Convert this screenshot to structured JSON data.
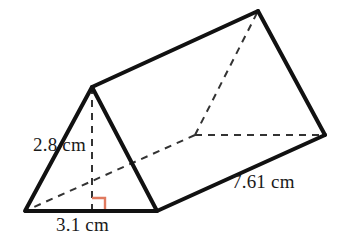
{
  "figure": {
    "name": "triangular-prism",
    "stroke_color": "#111111",
    "hidden_edge_color": "#333333",
    "right_angle_color": "#e07a5f",
    "background_color": "#ffffff",
    "solid_stroke_width": 4,
    "hidden_stroke_width": 2,
    "hidden_dash_pattern": "7,6"
  },
  "labels": {
    "height": "2.8 cm",
    "base": "3.1 cm",
    "length": "7.61 cm"
  },
  "measurements": {
    "triangle_height_cm": 2.8,
    "triangle_base_cm": 3.1,
    "prism_length_cm": 7.61,
    "units": "cm"
  },
  "geometry": {
    "vertices": {
      "front_apex": [
        92,
        87
      ],
      "front_bottom_left": [
        25,
        211
      ],
      "front_bottom_right": [
        157,
        211
      ],
      "back_apex": [
        258,
        11
      ],
      "back_bottom_left": [
        195,
        135
      ],
      "back_bottom_right": [
        325,
        135
      ],
      "height_foot": [
        92,
        211
      ]
    },
    "solid_edges": [
      [
        "front_apex",
        "front_bottom_left"
      ],
      [
        "front_apex",
        "front_bottom_right"
      ],
      [
        "front_bottom_left",
        "front_bottom_right"
      ],
      [
        "front_apex",
        "back_apex"
      ],
      [
        "back_apex",
        "back_bottom_right"
      ],
      [
        "front_bottom_right",
        "back_bottom_right"
      ]
    ],
    "hidden_edges": [
      [
        "back_bottom_left",
        "back_apex"
      ],
      [
        "back_bottom_left",
        "back_bottom_right"
      ],
      [
        "back_bottom_left",
        "front_bottom_left"
      ]
    ],
    "height_line": [
      "front_apex",
      "height_foot"
    ],
    "right_angle_marker": {
      "corner": [
        92,
        211
      ],
      "size": 13,
      "direction": "up-right"
    }
  }
}
